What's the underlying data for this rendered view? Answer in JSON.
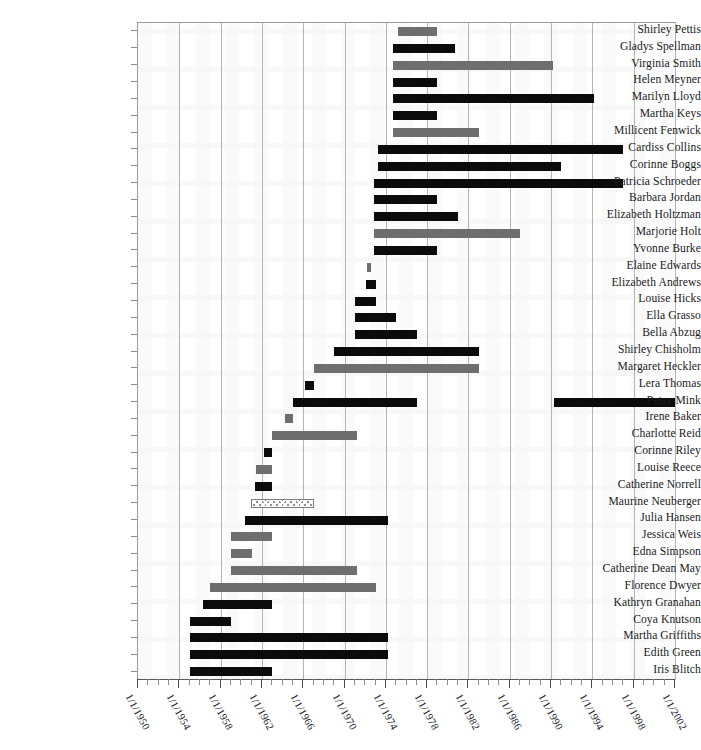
{
  "chart_data": {
    "type": "bar",
    "orientation": "horizontal-gantt",
    "title": "",
    "subtitle": "",
    "xlabel": "",
    "ylabel": "",
    "grid": true,
    "legend": "none",
    "xlim": [
      "1/1/1950",
      "1/1/2002"
    ],
    "x_tick_labels": [
      "1/1/1950",
      "1/1/1954",
      "1/1/1958",
      "1/1/1962",
      "1/1/1966",
      "1/1/1970",
      "1/1/1974",
      "1/1/1978",
      "1/1/1982",
      "1/1/1986",
      "1/1/1990",
      "1/1/1994",
      "1/1/1998",
      "1/1/2002"
    ],
    "x_tick_years": [
      1950,
      1954,
      1958,
      1962,
      1966,
      1970,
      1974,
      1978,
      1982,
      1986,
      1990,
      1994,
      1998,
      2002
    ],
    "minor_tick_interval_years": 1,
    "gridline_years": [
      1954,
      1958,
      1962,
      1966,
      1970,
      1974,
      1978,
      1982,
      1986,
      1990,
      1994,
      1998,
      2002
    ],
    "categories": [
      "Shirley Pettis",
      "Gladys Spellman",
      "Virginia Smith",
      "Helen Meyner",
      "Marilyn Lloyd",
      "Martha Keys",
      "Millicent Fenwick",
      "Cardiss Collins",
      "Corinne Boggs",
      "Patricia Schroeder",
      "Barbara Jordan",
      "Elizabeth Holtzman",
      "Marjorie Holt",
      "Yvonne Burke",
      "Elaine Edwards",
      "Elizabeth Andrews",
      "Louise Hicks",
      "Ella Grasso",
      "Bella Abzug",
      "Shirley Chisholm",
      "Margaret Heckler",
      "Lera Thomas",
      "Patsy Mink",
      "Irene Baker",
      "Charlotte Reid",
      "Corinne Riley",
      "Louise Reece",
      "Catherine Norrell",
      "Maurine Neuberger",
      "Julia Hansen",
      "Jessica Weis",
      "Edna Simpson",
      "Catherine Dean May",
      "Florence Dwyer",
      "Kathryn Granahan",
      "Coya Knutson",
      "Martha Griffiths",
      "Edith Green",
      "Iris Blitch"
    ],
    "series": [
      {
        "name": "Shirley Pettis",
        "color": "#6e6e6e",
        "style": "gray",
        "segments": [
          {
            "start": 1975.2,
            "end": 1979.0
          }
        ]
      },
      {
        "name": "Gladys Spellman",
        "color": "#0b0b0b",
        "style": "black",
        "segments": [
          {
            "start": 1974.7,
            "end": 1980.7
          }
        ]
      },
      {
        "name": "Virginia Smith",
        "color": "#6e6e6e",
        "style": "gray",
        "segments": [
          {
            "start": 1974.7,
            "end": 1990.2
          }
        ]
      },
      {
        "name": "Helen Meyner",
        "color": "#0b0b0b",
        "style": "black",
        "segments": [
          {
            "start": 1974.7,
            "end": 1979.0
          }
        ]
      },
      {
        "name": "Marilyn Lloyd",
        "color": "#0b0b0b",
        "style": "black",
        "segments": [
          {
            "start": 1974.7,
            "end": 1994.2
          }
        ]
      },
      {
        "name": "Martha Keys",
        "color": "#0b0b0b",
        "style": "black",
        "segments": [
          {
            "start": 1974.7,
            "end": 1979.0
          }
        ]
      },
      {
        "name": "Millicent Fenwick",
        "color": "#6e6e6e",
        "style": "gray",
        "segments": [
          {
            "start": 1974.7,
            "end": 1983.0
          }
        ]
      },
      {
        "name": "Cardiss Collins",
        "color": "#0b0b0b",
        "style": "black",
        "segments": [
          {
            "start": 1973.2,
            "end": 1997.0
          }
        ]
      },
      {
        "name": "Corinne Boggs",
        "color": "#0b0b0b",
        "style": "black",
        "segments": [
          {
            "start": 1973.2,
            "end": 1991.0
          }
        ]
      },
      {
        "name": "Patricia Schroeder",
        "color": "#0b0b0b",
        "style": "black",
        "segments": [
          {
            "start": 1972.9,
            "end": 1997.0
          }
        ]
      },
      {
        "name": "Barbara Jordan",
        "color": "#0b0b0b",
        "style": "black",
        "segments": [
          {
            "start": 1972.9,
            "end": 1979.0
          }
        ]
      },
      {
        "name": "Elizabeth Holtzman",
        "color": "#0b0b0b",
        "style": "black",
        "segments": [
          {
            "start": 1972.9,
            "end": 1981.0
          }
        ]
      },
      {
        "name": "Marjorie Holt",
        "color": "#6e6e6e",
        "style": "gray",
        "segments": [
          {
            "start": 1972.9,
            "end": 1987.0
          }
        ]
      },
      {
        "name": "Yvonne Burke",
        "color": "#0b0b0b",
        "style": "black",
        "segments": [
          {
            "start": 1972.9,
            "end": 1979.0
          }
        ]
      },
      {
        "name": "Elaine Edwards",
        "color": "#6e6e6e",
        "style": "gray",
        "segments": [
          {
            "start": 1972.2,
            "end": 1972.6
          }
        ]
      },
      {
        "name": "Elizabeth Andrews",
        "color": "#0b0b0b",
        "style": "black",
        "segments": [
          {
            "start": 1972.1,
            "end": 1973.0
          }
        ]
      },
      {
        "name": "Louise Hicks",
        "color": "#0b0b0b",
        "style": "black",
        "segments": [
          {
            "start": 1971.0,
            "end": 1973.0
          }
        ]
      },
      {
        "name": "Ella Grasso",
        "color": "#0b0b0b",
        "style": "black",
        "segments": [
          {
            "start": 1971.0,
            "end": 1975.0
          }
        ]
      },
      {
        "name": "Bella Abzug",
        "color": "#0b0b0b",
        "style": "black",
        "segments": [
          {
            "start": 1971.0,
            "end": 1977.0
          }
        ]
      },
      {
        "name": "Shirley Chisholm",
        "color": "#0b0b0b",
        "style": "black",
        "segments": [
          {
            "start": 1969.0,
            "end": 1983.0
          }
        ]
      },
      {
        "name": "Margaret Heckler",
        "color": "#6e6e6e",
        "style": "gray",
        "segments": [
          {
            "start": 1967.0,
            "end": 1983.0
          }
        ]
      },
      {
        "name": "Lera Thomas",
        "color": "#0b0b0b",
        "style": "black",
        "segments": [
          {
            "start": 1966.2,
            "end": 1967.0
          }
        ]
      },
      {
        "name": "Patsy Mink",
        "color": "#0b0b0b",
        "style": "black",
        "segments": [
          {
            "start": 1965.0,
            "end": 1977.0
          },
          {
            "start": 1990.3,
            "end": 2002.0
          }
        ]
      },
      {
        "name": "Irene Baker",
        "color": "#6e6e6e",
        "style": "gray",
        "segments": [
          {
            "start": 1964.2,
            "end": 1965.0
          }
        ]
      },
      {
        "name": "Charlotte Reid",
        "color": "#6e6e6e",
        "style": "gray",
        "segments": [
          {
            "start": 1963.0,
            "end": 1971.2
          }
        ]
      },
      {
        "name": "Corinne Riley",
        "color": "#0b0b0b",
        "style": "black",
        "segments": [
          {
            "start": 1962.2,
            "end": 1963.0
          }
        ]
      },
      {
        "name": "Louise Reece",
        "color": "#6e6e6e",
        "style": "gray",
        "segments": [
          {
            "start": 1961.4,
            "end": 1963.0
          }
        ]
      },
      {
        "name": "Catherine Norrell",
        "color": "#0b0b0b",
        "style": "black",
        "segments": [
          {
            "start": 1961.3,
            "end": 1963.0
          }
        ]
      },
      {
        "name": "Maurine Neuberger",
        "color": "#8f8f8f",
        "style": "hatch",
        "segments": [
          {
            "start": 1960.9,
            "end": 1967.0
          }
        ]
      },
      {
        "name": "Julia Hansen",
        "color": "#0b0b0b",
        "style": "black",
        "segments": [
          {
            "start": 1960.4,
            "end": 1974.2
          }
        ]
      },
      {
        "name": "Jessica Weis",
        "color": "#6e6e6e",
        "style": "gray",
        "segments": [
          {
            "start": 1959.0,
            "end": 1963.0
          }
        ]
      },
      {
        "name": "Edna Simpson",
        "color": "#6e6e6e",
        "style": "gray",
        "segments": [
          {
            "start": 1959.0,
            "end": 1961.0
          }
        ]
      },
      {
        "name": "Catherine Dean May",
        "color": "#6e6e6e",
        "style": "gray",
        "segments": [
          {
            "start": 1959.0,
            "end": 1971.2
          }
        ]
      },
      {
        "name": "Florence Dwyer",
        "color": "#6e6e6e",
        "style": "gray",
        "segments": [
          {
            "start": 1957.0,
            "end": 1973.0
          }
        ]
      },
      {
        "name": "Kathryn Granahan",
        "color": "#0b0b0b",
        "style": "black",
        "segments": [
          {
            "start": 1956.3,
            "end": 1963.0
          }
        ]
      },
      {
        "name": "Coya Knutson",
        "color": "#0b0b0b",
        "style": "black",
        "segments": [
          {
            "start": 1955.0,
            "end": 1959.0
          }
        ]
      },
      {
        "name": "Martha Griffiths",
        "color": "#0b0b0b",
        "style": "black",
        "segments": [
          {
            "start": 1955.0,
            "end": 1974.2
          }
        ]
      },
      {
        "name": "Edith Green",
        "color": "#0b0b0b",
        "style": "black",
        "segments": [
          {
            "start": 1955.0,
            "end": 1974.2
          }
        ]
      },
      {
        "name": "Iris Blitch",
        "color": "#0b0b0b",
        "style": "black",
        "segments": [
          {
            "start": 1955.0,
            "end": 1963.0
          }
        ]
      }
    ]
  }
}
